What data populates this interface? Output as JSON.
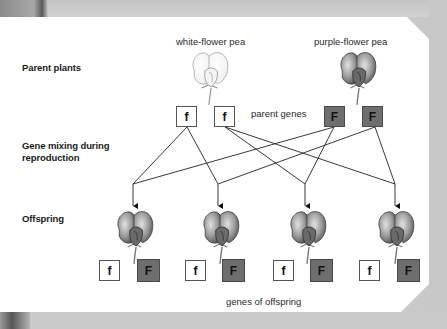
{
  "row_labels": {
    "parents": "Parent plants",
    "mixing_line1": "Gene mixing during",
    "mixing_line2": "reproduction",
    "offspring": "Offspring"
  },
  "parents": [
    {
      "label": "white-flower pea",
      "flower_color": "white",
      "genes": [
        "f",
        "f"
      ]
    },
    {
      "label": "purple-flower pea",
      "flower_color": "purple",
      "genes": [
        "F",
        "F"
      ]
    }
  ],
  "parent_genes_label": "parent genes",
  "offspring": [
    {
      "genes": [
        "f",
        "F"
      ]
    },
    {
      "genes": [
        "f",
        "F"
      ]
    },
    {
      "genes": [
        "f",
        "F"
      ]
    },
    {
      "genes": [
        "f",
        "F"
      ]
    }
  ],
  "offspring_genes_label": "genes of offspring",
  "colors": {
    "dominant_box": "#6e6e6e",
    "recessive_box": "#ffffff",
    "frame": "#c8c8c8"
  }
}
